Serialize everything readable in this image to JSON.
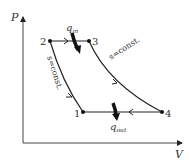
{
  "axes": {
    "y_label": "P",
    "x_label": "V"
  },
  "points": [
    {
      "id": "1",
      "label": "1",
      "x": 83,
      "y": 112
    },
    {
      "id": "2",
      "label": "2",
      "x": 50,
      "y": 41
    },
    {
      "id": "3",
      "label": "3",
      "x": 89,
      "y": 41
    },
    {
      "id": "4",
      "label": "4",
      "x": 162,
      "y": 112
    }
  ],
  "processes": {
    "compression": {
      "from": "1",
      "to": "2",
      "label": "s=const."
    },
    "heat_addition": {
      "from": "2",
      "to": "3",
      "label": "q",
      "subscript": "in"
    },
    "expansion": {
      "from": "3",
      "to": "4",
      "label": "s=const."
    },
    "heat_rejection": {
      "from": "4",
      "to": "1",
      "label": "q",
      "subscript": "out"
    }
  },
  "colors": {
    "line": "#222222",
    "text": "#333333"
  }
}
